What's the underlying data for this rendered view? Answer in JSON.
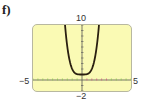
{
  "panel_label": "f)",
  "colors": {
    "background": "#fafab4",
    "curve": "#2a1f10",
    "axis": "#555555",
    "tick_green": "#8cc850",
    "tick_red": "#d06080"
  },
  "chart_data": {
    "type": "line",
    "title": "",
    "panel": "f)",
    "xlabel": "",
    "ylabel": "",
    "xlim": [
      -5,
      5
    ],
    "ylim": [
      -2,
      10
    ],
    "tick_labels": {
      "x_min": "−5",
      "x_max": "5",
      "y_min": "−2",
      "y_max": "10"
    },
    "grid": false,
    "series": [
      {
        "name": "curve",
        "description": "U-shaped even-degree curve with minimum near (0, 1)",
        "x": [
          -1.8,
          -1.5,
          -1.0,
          -0.5,
          0,
          0.5,
          1.0,
          1.5,
          1.8
        ],
        "y": [
          11.5,
          6.1,
          2.0,
          1.06,
          1.0,
          1.06,
          2.0,
          6.1,
          11.5
        ]
      }
    ]
  }
}
